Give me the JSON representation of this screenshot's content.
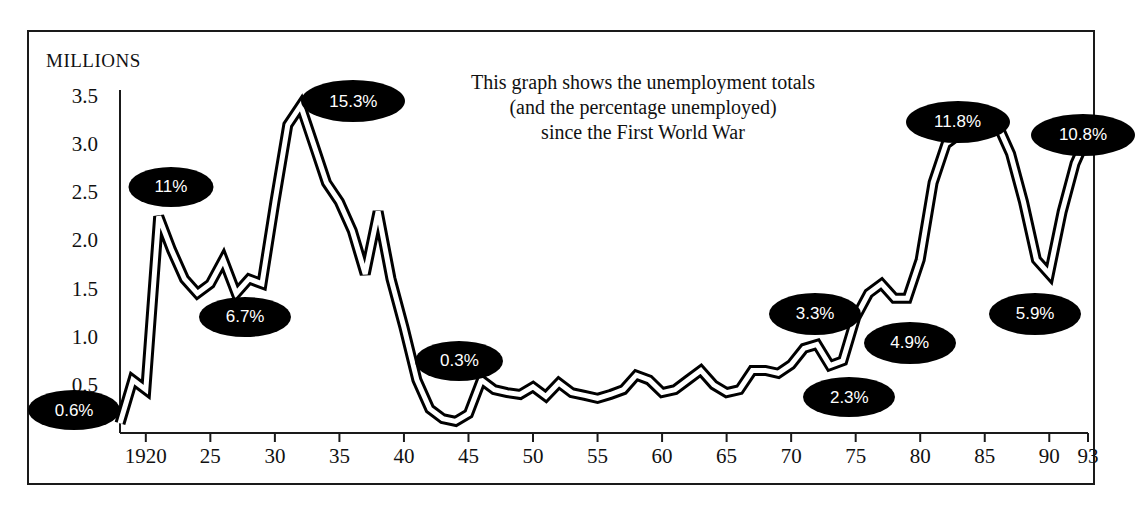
{
  "chart_data": {
    "type": "line",
    "title": "This graph shows the unemployment totals (and the percentage unemployed) since the First World War",
    "title_lines": [
      "This graph shows the unemployment totals",
      "(and the percentage unemployed)",
      "since the First World War"
    ],
    "ylabel": "MILLIONS",
    "xlabel": "",
    "ylim": [
      0,
      3.5
    ],
    "xlim": [
      1918,
      1993
    ],
    "grid": false,
    "legend": false,
    "yticks": [
      "3.5",
      "3.0",
      "2.5",
      "2.0",
      "1.5",
      "1.0",
      "0.5"
    ],
    "ytick_values": [
      3.5,
      3.0,
      2.5,
      2.0,
      1.5,
      1.0,
      0.5
    ],
    "xticks": [
      "1920",
      "25",
      "30",
      "35",
      "40",
      "45",
      "50",
      "55",
      "60",
      "65",
      "70",
      "75",
      "80",
      "85",
      "90",
      "93"
    ],
    "xtick_values": [
      1920,
      1925,
      1930,
      1935,
      1940,
      1945,
      1950,
      1955,
      1960,
      1965,
      1970,
      1975,
      1980,
      1985,
      1990,
      1993
    ],
    "series_name": "Unemployment total (millions)",
    "x": [
      1918,
      1919,
      1920,
      1921,
      1922,
      1923,
      1924,
      1925,
      1926,
      1927,
      1928,
      1929,
      1930,
      1931,
      1932,
      1933,
      1934,
      1935,
      1936,
      1937,
      1938,
      1939,
      1940,
      1941,
      1942,
      1943,
      1944,
      1945,
      1946,
      1947,
      1948,
      1949,
      1950,
      1951,
      1952,
      1953,
      1954,
      1955,
      1956,
      1957,
      1958,
      1959,
      1960,
      1961,
      1962,
      1963,
      1964,
      1965,
      1966,
      1967,
      1968,
      1969,
      1970,
      1971,
      1972,
      1973,
      1974,
      1975,
      1976,
      1977,
      1978,
      1979,
      1980,
      1981,
      1982,
      1983,
      1984,
      1985,
      1986,
      1987,
      1988,
      1989,
      1990,
      1991,
      1992,
      1993
    ],
    "values": [
      0.1,
      0.55,
      0.45,
      2.25,
      1.9,
      1.6,
      1.45,
      1.55,
      1.8,
      1.45,
      1.6,
      1.55,
      2.4,
      3.2,
      3.4,
      3.0,
      2.6,
      2.4,
      2.1,
      1.65,
      2.3,
      1.6,
      1.1,
      0.55,
      0.25,
      0.15,
      0.12,
      0.2,
      0.55,
      0.45,
      0.42,
      0.4,
      0.48,
      0.38,
      0.52,
      0.42,
      0.39,
      0.36,
      0.4,
      0.45,
      0.6,
      0.55,
      0.42,
      0.45,
      0.55,
      0.65,
      0.5,
      0.42,
      0.45,
      0.65,
      0.65,
      0.62,
      0.71,
      0.88,
      0.92,
      0.7,
      0.75,
      1.2,
      1.45,
      1.55,
      1.4,
      1.4,
      1.8,
      2.6,
      3.0,
      3.1,
      3.15,
      3.2,
      3.2,
      2.9,
      2.4,
      1.8,
      1.65,
      2.3,
      2.8,
      3.1
    ],
    "annotations": [
      {
        "label": "0.6%",
        "x_left_pct": 6.5,
        "y_top_pct": 79.0,
        "w": 92,
        "h": 40,
        "year": 1920,
        "value": 0.6
      },
      {
        "label": "11%",
        "x_left_pct": 15.0,
        "y_top_pct": 36.0,
        "w": 85,
        "h": 40,
        "year": 1921,
        "value": 11.0
      },
      {
        "label": "6.7%",
        "x_left_pct": 21.5,
        "y_top_pct": 61.0,
        "w": 92,
        "h": 40,
        "year": 1927,
        "value": 6.7
      },
      {
        "label": "15.3%",
        "x_left_pct": 31.0,
        "y_top_pct": 19.5,
        "w": 104,
        "h": 42,
        "year": 1932,
        "value": 15.3
      },
      {
        "label": "0.3%",
        "x_left_pct": 40.3,
        "y_top_pct": 69.5,
        "w": 88,
        "h": 40,
        "year": 1944,
        "value": 0.3
      },
      {
        "label": "3.3%",
        "x_left_pct": 71.5,
        "y_top_pct": 60.5,
        "w": 92,
        "h": 42,
        "year": 1972,
        "value": 3.3
      },
      {
        "label": "2.3%",
        "x_left_pct": 74.5,
        "y_top_pct": 76.5,
        "w": 92,
        "h": 40,
        "year": 1973,
        "value": 2.3
      },
      {
        "label": "4.9%",
        "x_left_pct": 79.8,
        "y_top_pct": 66.0,
        "w": 92,
        "h": 42,
        "year": 1978,
        "value": 4.9
      },
      {
        "label": "11.8%",
        "x_left_pct": 84.0,
        "y_top_pct": 23.5,
        "w": 104,
        "h": 42,
        "year": 1982,
        "value": 11.8
      },
      {
        "label": "5.9%",
        "x_left_pct": 90.8,
        "y_top_pct": 60.5,
        "w": 92,
        "h": 42,
        "year": 1990,
        "value": 5.9
      },
      {
        "label": "10.8%",
        "x_left_pct": 95.0,
        "y_top_pct": 26.0,
        "w": 104,
        "h": 42,
        "year": 1993,
        "value": 10.8
      }
    ],
    "colors": {
      "line": "#000000",
      "line_highlight": "#ffffff",
      "axis": "#1a1a1a",
      "bubble_bg": "#000000",
      "bubble_text": "#ffffff",
      "background": "#ffffff"
    }
  }
}
